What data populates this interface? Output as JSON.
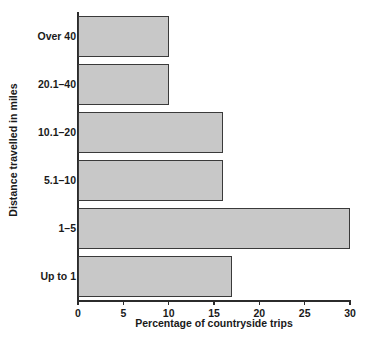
{
  "chart_data": {
    "type": "bar",
    "orientation": "horizontal",
    "title": "",
    "xlabel": "Percentage of countryside trips",
    "ylabel": "Distance travelled in miles",
    "categories": [
      "Up to 1",
      "1–5",
      "5.1–10",
      "10.1–20",
      "20.1–40",
      "Over 40"
    ],
    "values": [
      17,
      30,
      16,
      16,
      10,
      10
    ],
    "xlim": [
      0,
      30
    ],
    "xticks": [
      0,
      5,
      10,
      15,
      20,
      25,
      30
    ],
    "xtick_labels": [
      "0",
      "5",
      "10",
      "15",
      "20",
      "25",
      "30"
    ],
    "grid": false,
    "legend": null,
    "bar_fill_color": "#c8c8c8",
    "bar_edge_color": "#3a3a3a",
    "axis_color": "#2b2b2b",
    "background_color": "#ffffff",
    "category_order_top_to_bottom": [
      "Over 40",
      "20.1–40",
      "10.1–20",
      "5.1–10",
      "1–5",
      "Up to 1"
    ],
    "values_top_to_bottom": [
      10,
      10,
      16,
      16,
      30,
      17
    ]
  }
}
